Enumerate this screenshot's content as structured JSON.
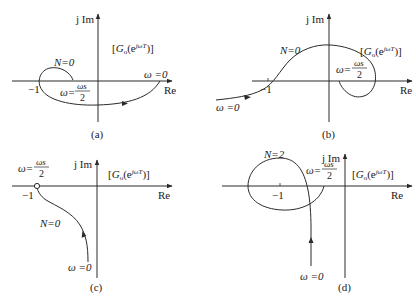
{
  "figure": {
    "panels": [
      {
        "id": "a",
        "caption": "(a)",
        "axis_x_label": "Re",
        "axis_y_label": "j Im",
        "transfer_label_pre": "[",
        "transfer_label_G": "G",
        "transfer_label_sub": "o",
        "transfer_label_mid": "(e",
        "transfer_label_exp": "jωT",
        "transfer_label_post": ")]",
        "minus_one": "−1",
        "encirclement": "N=0",
        "omega_start": "ω =0",
        "omega_half_prefix": "ω=",
        "omega_half_num": "ωs",
        "omega_half_den": "2"
      },
      {
        "id": "b",
        "caption": "(b)",
        "axis_x_label": "Re",
        "axis_y_label": "j Im",
        "transfer_label_pre": "[",
        "transfer_label_G": "G",
        "transfer_label_sub": "o",
        "transfer_label_mid": "(e",
        "transfer_label_exp": "jωT",
        "transfer_label_post": ")]",
        "minus_one": "−1",
        "encirclement": "N=0",
        "omega_start": "ω =0",
        "omega_half_prefix": "ω=",
        "omega_half_num": "ωs",
        "omega_half_den": "2"
      },
      {
        "id": "c",
        "caption": "(c)",
        "axis_x_label": "Re",
        "axis_y_label": "j Im",
        "transfer_label_pre": "[",
        "transfer_label_G": "G",
        "transfer_label_sub": "o",
        "transfer_label_mid": "(e",
        "transfer_label_exp": "jωT",
        "transfer_label_post": ")]",
        "minus_one": "−1",
        "encirclement": "N=0",
        "omega_start": "ω =0",
        "omega_half_prefix": "ω=",
        "omega_half_num": "ωs",
        "omega_half_den": "2"
      },
      {
        "id": "d",
        "caption": "(d)",
        "axis_x_label": "Re",
        "axis_y_label": "j Im",
        "transfer_label_pre": "[",
        "transfer_label_G": "G",
        "transfer_label_sub": "o",
        "transfer_label_mid": "(e",
        "transfer_label_exp": "jωT",
        "transfer_label_post": ")]",
        "minus_one": "−1",
        "encirclement": "N=2",
        "omega_start": "ω =0",
        "omega_half_prefix": "ω=",
        "omega_half_num": "ωs",
        "omega_half_den": "2"
      }
    ]
  }
}
